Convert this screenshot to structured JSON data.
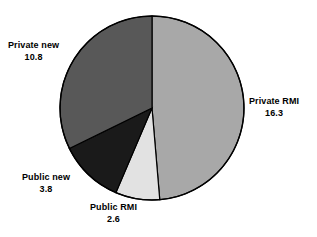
{
  "chart_data": {
    "type": "pie",
    "title": "",
    "subtitle": "",
    "xlabel": "",
    "ylabel": "",
    "legend_position": "none",
    "grid": false,
    "total": 33.5,
    "start_angle_deg": 0,
    "direction": "clockwise",
    "categories": [
      "Private RMI",
      "Public RMI",
      "Public new",
      "Private new"
    ],
    "values": [
      16.3,
      2.6,
      3.8,
      10.8
    ],
    "slices": [
      {
        "label": "Private RMI",
        "value": "16.3",
        "numeric": 16.3,
        "color": "#a8a8a8",
        "start_deg": 0,
        "end_deg": 175.2,
        "label_position": "right"
      },
      {
        "label": "Public RMI",
        "value": "2.6",
        "numeric": 2.6,
        "color": "#e2e2e2",
        "start_deg": 175.2,
        "end_deg": 203.1,
        "label_position": "bottom"
      },
      {
        "label": "Public new",
        "value": "3.8",
        "numeric": 3.8,
        "color": "#1a1a1a",
        "start_deg": 203.1,
        "end_deg": 243.9,
        "label_position": "bottom-left"
      },
      {
        "label": "Private new",
        "value": "10.8",
        "numeric": 10.8,
        "color": "#585858",
        "start_deg": 243.9,
        "end_deg": 360,
        "label_position": "top-left"
      }
    ],
    "geometry": {
      "center_x": 152,
      "center_y": 108,
      "radius": 92,
      "outline_color": "#000000",
      "background": "#ffffff"
    }
  },
  "labels": {
    "private_new": {
      "name": "Private new",
      "value": "10.8"
    },
    "private_rmi": {
      "name": "Private RMI",
      "value": "16.3"
    },
    "public_new": {
      "name": "Public new",
      "value": "3.8"
    },
    "public_rmi": {
      "name": "Public RMI",
      "value": "2.6"
    }
  }
}
